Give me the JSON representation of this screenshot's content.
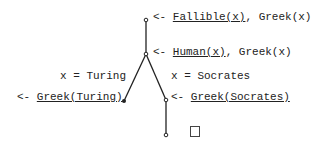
{
  "diagram": {
    "type": "resolution-tree",
    "nodes": [
      {
        "id": "root",
        "arrow": "<-",
        "literal": "Fallible(x)",
        "rest": ", Greek(x)"
      },
      {
        "id": "human",
        "arrow": "<-",
        "literal": "Human(x)",
        "rest": ", Greek(x)"
      },
      {
        "id": "turing",
        "arrow": "<-",
        "literal": "Greek(Turing)",
        "rest": ""
      },
      {
        "id": "socrates",
        "arrow": "<-",
        "literal": "Greek(Socrates)",
        "rest": ""
      },
      {
        "id": "empty",
        "symbol": "□"
      }
    ],
    "edge_labels": {
      "left": "x = Turing",
      "right": "x = Socrates"
    },
    "colors": {
      "line": "#222222",
      "text": "#222222",
      "background": "#ffffff"
    }
  }
}
